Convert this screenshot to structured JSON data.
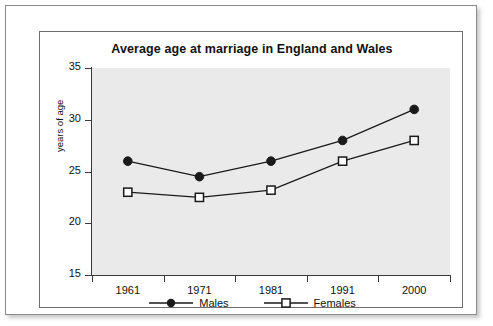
{
  "chart_data": {
    "type": "line",
    "title": "Average age at marriage in England and Wales",
    "xlabel": "",
    "ylabel": "years of age",
    "categories": [
      "1961",
      "1971",
      "1981",
      "1991",
      "2000"
    ],
    "series": [
      {
        "name": "Males",
        "marker": "filled-circle",
        "color": "#1a1a1a",
        "values": [
          26,
          24.5,
          26,
          28,
          31
        ]
      },
      {
        "name": "Females",
        "marker": "open-square",
        "color": "#1a1a1a",
        "values": [
          23,
          22.5,
          23.2,
          26,
          28
        ]
      }
    ],
    "ylim": [
      15,
      35
    ],
    "yticks": [
      15,
      20,
      25,
      30,
      35
    ],
    "ytick_labels": [
      "15",
      "20",
      "25",
      "30",
      "35"
    ],
    "grid": false,
    "legend_position": "bottom",
    "plot_background": "#eaeaea",
    "axis_color": "#3a3a3a",
    "text_color": "#111111"
  },
  "legend": {
    "items": [
      {
        "label": "Males",
        "marker": "filled-circle"
      },
      {
        "label": "Females",
        "marker": "open-square"
      }
    ]
  }
}
